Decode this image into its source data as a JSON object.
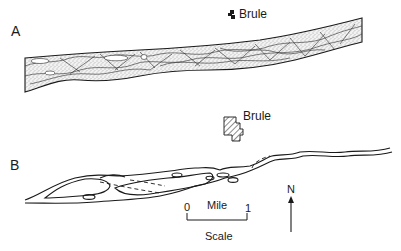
{
  "figure": {
    "panels": [
      {
        "id": "A",
        "letter": "A",
        "description": "Braided river channel with stippled sand bars",
        "town": {
          "name": "Brule",
          "symbol": "small-solid-town-icon"
        }
      },
      {
        "id": "B",
        "letter": "B",
        "description": "Narrow anastomosing river channel with islands and dashed abandoned channels",
        "town": {
          "name": "Brule",
          "symbol": "hatched-town-icon"
        }
      }
    ],
    "scale": {
      "start_label": "0",
      "end_label": "1",
      "unit_label": "Mile",
      "caption": "Scale"
    },
    "north_arrow": {
      "label": "N"
    },
    "colors": {
      "ink": "#1a1a1a",
      "stipple": "#6b6b6b",
      "fill": "#e6e6e6",
      "background": "#ffffff"
    }
  }
}
